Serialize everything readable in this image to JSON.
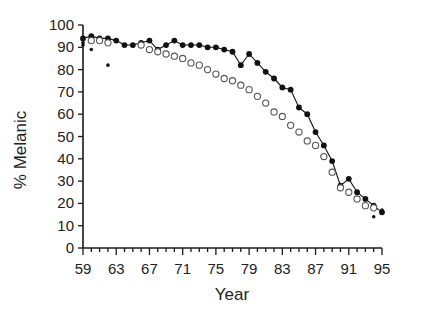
{
  "chart_data": {
    "type": "line",
    "title": "",
    "xlabel": "Year",
    "ylabel": "% Melanic",
    "xlim": [
      59,
      95
    ],
    "ylim": [
      0,
      100
    ],
    "grid": false,
    "legend": "none",
    "x_tick_labels": [
      "59",
      "63",
      "67",
      "71",
      "75",
      "79",
      "83",
      "87",
      "91",
      "95"
    ],
    "x_tick_values": [
      59,
      63,
      67,
      71,
      75,
      79,
      83,
      87,
      91,
      95
    ],
    "x_minor_tick_values": [
      59,
      60,
      61,
      62,
      63,
      64,
      65,
      66,
      67,
      68,
      69,
      70,
      71,
      72,
      73,
      74,
      75,
      76,
      77,
      78,
      79,
      80,
      81,
      82,
      83,
      84,
      85,
      86,
      87,
      88,
      89,
      90,
      91,
      92,
      93,
      94,
      95
    ],
    "y_tick_labels": [
      "0",
      "10",
      "20",
      "30",
      "40",
      "50",
      "60",
      "70",
      "80",
      "90",
      "100"
    ],
    "y_tick_values": [
      0,
      10,
      20,
      30,
      40,
      50,
      60,
      70,
      80,
      90,
      100
    ],
    "series": [
      {
        "name": "filled-circles",
        "marker": "filled-circle",
        "connected": true,
        "color": "#111111",
        "x": [
          59,
          60,
          61,
          62,
          63,
          64,
          65,
          66,
          67,
          68,
          69,
          70,
          71,
          72,
          73,
          74,
          75,
          76,
          77,
          78,
          79,
          80,
          81,
          82,
          83,
          84,
          85,
          86,
          87,
          88,
          89,
          90,
          91,
          92,
          93,
          94,
          95
        ],
        "values": [
          94,
          95,
          94,
          94,
          93,
          91,
          91,
          92,
          93,
          89,
          91,
          93,
          91,
          91,
          91,
          90,
          90,
          89,
          88,
          82,
          87,
          83,
          79,
          76,
          72,
          71,
          63,
          60,
          52,
          46,
          39,
          28,
          31,
          25,
          22,
          19,
          16
        ]
      },
      {
        "name": "open-circles",
        "marker": "open-circle",
        "connected": false,
        "color": "#555555",
        "x": [
          60,
          61,
          62,
          66,
          67,
          68,
          69,
          70,
          71,
          72,
          73,
          74,
          75,
          76,
          77,
          78,
          79,
          80,
          81,
          82,
          83,
          84,
          85,
          86,
          87,
          88,
          89,
          90,
          91,
          92,
          93,
          94
        ],
        "values": [
          93,
          93,
          92,
          91,
          89,
          88,
          87,
          86,
          85,
          83,
          82,
          80,
          78,
          76,
          75,
          73,
          71,
          68,
          65,
          61,
          59,
          55,
          52,
          48,
          46,
          41,
          34,
          27,
          25,
          22,
          19,
          18
        ]
      },
      {
        "name": "small-dots",
        "marker": "small-dot",
        "connected": false,
        "color": "#111111",
        "x": [
          59,
          59,
          60,
          62,
          95,
          94
        ],
        "values": [
          92,
          91,
          89,
          82,
          17,
          14
        ]
      }
    ]
  },
  "axis": {
    "x_title": "Year",
    "y_title": "% Melanic"
  }
}
